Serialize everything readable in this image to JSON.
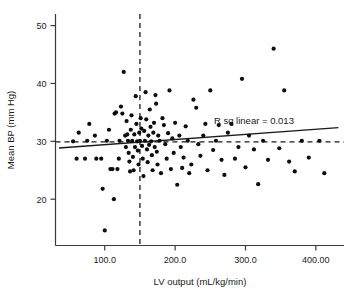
{
  "chart_data": {
    "type": "scatter",
    "title": "",
    "xlabel": "LV output (mL/kg/min)",
    "ylabel": "Mean BP (mm Hg)",
    "xlim": [
      30,
      440
    ],
    "ylim": [
      12,
      52
    ],
    "grid": false,
    "legend": null,
    "xticks": [
      100,
      200,
      300,
      400
    ],
    "xticklabels": [
      "100.0",
      "200.0",
      "300.0",
      "400.00"
    ],
    "yticks": [
      20,
      30,
      40,
      50
    ],
    "yticklabels": [
      "20",
      "30",
      "40",
      "50"
    ],
    "annotations": [
      {
        "name": "r-squared-label",
        "text": "R sq linear = 0.013",
        "x": 312,
        "y": 33.0
      }
    ],
    "reference_lines": [
      {
        "name": "vertical-reference",
        "orientation": "vertical",
        "value": 150,
        "style": "dashed"
      },
      {
        "name": "horizontal-reference",
        "orientation": "horizontal",
        "value": 29.9,
        "style": "dashed"
      }
    ],
    "fit_line": {
      "name": "linear-regression-line",
      "style": "solid",
      "x_start": 35,
      "y_start": 28.85,
      "x_end": 432,
      "y_end": 32.35,
      "r_squared": 0.013
    },
    "series": [
      {
        "name": "observations",
        "marker": "circle",
        "color": "#0d0d0d",
        "points": [
          [
            55,
            30.0
          ],
          [
            60,
            27.0
          ],
          [
            63,
            31.5
          ],
          [
            72,
            27.0
          ],
          [
            75,
            30.1
          ],
          [
            78,
            33.0
          ],
          [
            86,
            31.0
          ],
          [
            88,
            27.0
          ],
          [
            95,
            27.0
          ],
          [
            97,
            21.8
          ],
          [
            100,
            14.6
          ],
          [
            103,
            30.1
          ],
          [
            106,
            32.0
          ],
          [
            108,
            25.2
          ],
          [
            111,
            25.2
          ],
          [
            113,
            20.0
          ],
          [
            114,
            34.8
          ],
          [
            116,
            35.0
          ],
          [
            118,
            25.2
          ],
          [
            120,
            27.0
          ],
          [
            121,
            30.1
          ],
          [
            123,
            36.0
          ],
          [
            125,
            34.8
          ],
          [
            127,
            42.0
          ],
          [
            129,
            31.0
          ],
          [
            130,
            29.0
          ],
          [
            131,
            33.5
          ],
          [
            132,
            31.2
          ],
          [
            133,
            30.1
          ],
          [
            134,
            28.0
          ],
          [
            135,
            26.5
          ],
          [
            136,
            24.8
          ],
          [
            137,
            32.0
          ],
          [
            138,
            34.5
          ],
          [
            139,
            30.1
          ],
          [
            140,
            27.3
          ],
          [
            141,
            25.0
          ],
          [
            142,
            31.2
          ],
          [
            143,
            29.0
          ],
          [
            144,
            37.8
          ],
          [
            145,
            33.0
          ],
          [
            146,
            30.0
          ],
          [
            147,
            28.4
          ],
          [
            148,
            26.0
          ],
          [
            149,
            31.5
          ],
          [
            150,
            30.1
          ],
          [
            151,
            34.0
          ],
          [
            152,
            32.2
          ],
          [
            153,
            29.2
          ],
          [
            154,
            27.0
          ],
          [
            155,
            24.0
          ],
          [
            156,
            31.8
          ],
          [
            157,
            30.1
          ],
          [
            158,
            38.5
          ],
          [
            159,
            33.8
          ],
          [
            160,
            28.6
          ],
          [
            161,
            26.4
          ],
          [
            162,
            31.0
          ],
          [
            163,
            29.4
          ],
          [
            164,
            35.5
          ],
          [
            165,
            32.5
          ],
          [
            166,
            30.0
          ],
          [
            167,
            27.6
          ],
          [
            168,
            25.0
          ],
          [
            169,
            31.5
          ],
          [
            170,
            33.2
          ],
          [
            171,
            29.0
          ],
          [
            172,
            38.0
          ],
          [
            173,
            36.5
          ],
          [
            174,
            28.2
          ],
          [
            175,
            26.0
          ],
          [
            176,
            31.0
          ],
          [
            178,
            30.1
          ],
          [
            180,
            24.5
          ],
          [
            182,
            34.0
          ],
          [
            184,
            32.8
          ],
          [
            186,
            29.5
          ],
          [
            188,
            27.0
          ],
          [
            190,
            31.4
          ],
          [
            192,
            38.8
          ],
          [
            194,
            25.2
          ],
          [
            196,
            30.5
          ],
          [
            198,
            28.0
          ],
          [
            200,
            33.2
          ],
          [
            203,
            22.5
          ],
          [
            206,
            31.0
          ],
          [
            208,
            29.0
          ],
          [
            210,
            25.4
          ],
          [
            212,
            27.2
          ],
          [
            215,
            32.6
          ],
          [
            218,
            30.1
          ],
          [
            220,
            24.5
          ],
          [
            223,
            26.0
          ],
          [
            226,
            37.2
          ],
          [
            230,
            35.8
          ],
          [
            233,
            29.5
          ],
          [
            236,
            27.5
          ],
          [
            240,
            31.0
          ],
          [
            243,
            33.0
          ],
          [
            246,
            25.0
          ],
          [
            250,
            38.8
          ],
          [
            254,
            28.5
          ],
          [
            258,
            30.1
          ],
          [
            262,
            32.8
          ],
          [
            266,
            26.8
          ],
          [
            270,
            24.2
          ],
          [
            275,
            31.5
          ],
          [
            280,
            33.0
          ],
          [
            285,
            27.0
          ],
          [
            290,
            29.0
          ],
          [
            295,
            40.8
          ],
          [
            300,
            25.5
          ],
          [
            305,
            31.0
          ],
          [
            312,
            28.6
          ],
          [
            318,
            22.6
          ],
          [
            325,
            30.1
          ],
          [
            332,
            26.8
          ],
          [
            340,
            46.0
          ],
          [
            348,
            28.8
          ],
          [
            355,
            38.8
          ],
          [
            362,
            26.5
          ],
          [
            370,
            24.8
          ],
          [
            380,
            30.1
          ],
          [
            390,
            27.2
          ],
          [
            405,
            30.1
          ],
          [
            412,
            24.5
          ]
        ]
      }
    ]
  },
  "axes": {
    "x_axis_name": "x-axis",
    "y_axis_name": "y-axis"
  }
}
